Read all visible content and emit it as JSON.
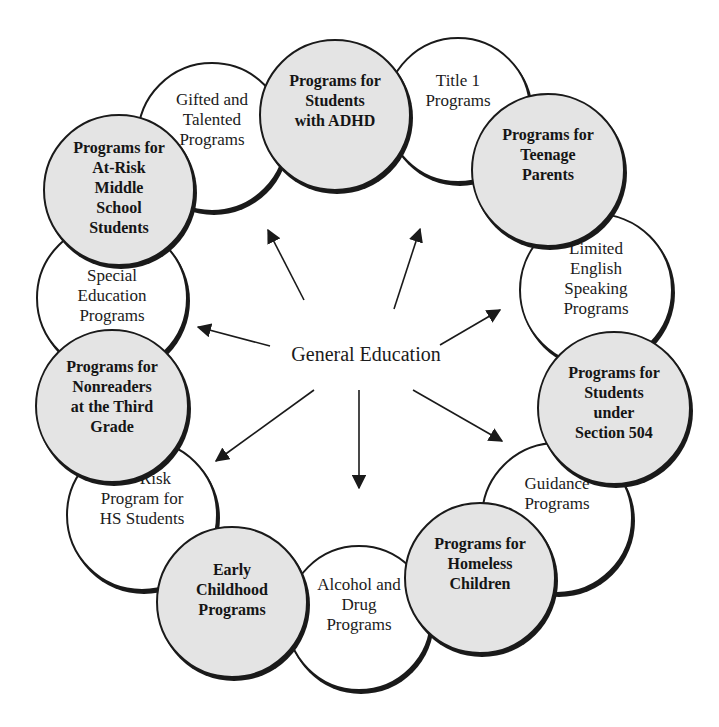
{
  "diagram": {
    "center": {
      "label": "General Education"
    },
    "colors": {
      "shaded": "#e4e4e4",
      "plain": "#ffffff",
      "stroke": "#1a1a1a"
    },
    "nodes": [
      {
        "id": "gifted",
        "label": "Gifted and\nTalented\nPrograms",
        "shaded": false,
        "cx": 212,
        "cy": 137,
        "r": 75,
        "pad": 26
      },
      {
        "id": "title1",
        "label": "Title 1\nPrograms",
        "shaded": false,
        "cx": 458,
        "cy": 110,
        "r": 73,
        "pad": 32
      },
      {
        "id": "limited-english",
        "label": "Limited\nEnglish\nSpeaking\nPrograms",
        "shaded": false,
        "cx": 596,
        "cy": 290,
        "r": 77,
        "pad": 24
      },
      {
        "id": "guidance",
        "label": "Guidance\nPrograms",
        "shaded": false,
        "cx": 557,
        "cy": 518,
        "r": 76,
        "pad": 30
      },
      {
        "id": "alcohol-drug",
        "label": "Alcohol and\nDrug\nPrograms",
        "shaded": false,
        "cx": 359,
        "cy": 618,
        "r": 73,
        "pad": 28
      },
      {
        "id": "at-risk-hs",
        "label": "At- Risk\nProgram for\nHS Students",
        "shaded": false,
        "cx": 142,
        "cy": 515,
        "r": 76,
        "pad": 28
      },
      {
        "id": "special-ed",
        "label": "Special\nEducation\nPrograms",
        "shaded": false,
        "cx": 112,
        "cy": 298,
        "r": 76,
        "pad": 42
      },
      {
        "id": "adhd",
        "label": "Programs for\nStudents\nwith ADHD",
        "shaded": true,
        "cx": 335,
        "cy": 115,
        "r": 76,
        "pad": 30
      },
      {
        "id": "teenage-parents",
        "label": "Programs for\nTeenage\nParents",
        "shaded": true,
        "cx": 548,
        "cy": 170,
        "r": 77,
        "pad": 30
      },
      {
        "id": "section-504",
        "label": "Programs for\nStudents\nunder\nSection 504",
        "shaded": true,
        "cx": 614,
        "cy": 408,
        "r": 77,
        "pad": 30
      },
      {
        "id": "homeless",
        "label": "Programs for\nHomeless\nChildren",
        "shaded": true,
        "cx": 480,
        "cy": 578,
        "r": 76,
        "pad": 30
      },
      {
        "id": "early-childhood",
        "label": "Early\nChildhood\nPrograms",
        "shaded": true,
        "cx": 232,
        "cy": 602,
        "r": 76,
        "pad": 32
      },
      {
        "id": "nonreaders",
        "label": "Programs for\nNonreaders\nat the Third\nGrade",
        "shaded": true,
        "cx": 112,
        "cy": 406,
        "r": 77,
        "pad": 26
      },
      {
        "id": "at-risk-middle",
        "label": "Programs for\nAt-Risk\nMiddle\nSchool\nStudents",
        "shaded": true,
        "cx": 119,
        "cy": 190,
        "r": 76,
        "pad": 22
      }
    ],
    "arrows": [
      {
        "x1": 304,
        "y1": 300,
        "x2": 268,
        "y2": 230
      },
      {
        "x1": 394,
        "y1": 309,
        "x2": 420,
        "y2": 229
      },
      {
        "x1": 440,
        "y1": 345,
        "x2": 500,
        "y2": 310
      },
      {
        "x1": 270,
        "y1": 346,
        "x2": 198,
        "y2": 327
      },
      {
        "x1": 314,
        "y1": 390,
        "x2": 216,
        "y2": 461
      },
      {
        "x1": 359,
        "y1": 390,
        "x2": 359,
        "y2": 488
      },
      {
        "x1": 413,
        "y1": 390,
        "x2": 502,
        "y2": 441
      }
    ]
  }
}
